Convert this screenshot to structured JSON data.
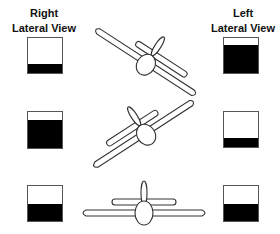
{
  "labels": {
    "right_view": {
      "line1": "Right",
      "line2": "Lateral View"
    },
    "left_view": {
      "line1": "Left",
      "line2": "Lateral View"
    }
  },
  "colors": {
    "fill": "#000000",
    "box_border": "#555555",
    "outline": "#333333",
    "background": "#ffffff"
  },
  "rows": [
    {
      "attitude": "banked-right",
      "right_box_fill_pct": 27,
      "left_box_fill_pct": 80
    },
    {
      "attitude": "banked-left",
      "right_box_fill_pct": 78,
      "left_box_fill_pct": 27
    },
    {
      "attitude": "level",
      "right_box_fill_pct": 50,
      "left_box_fill_pct": 50
    }
  ]
}
